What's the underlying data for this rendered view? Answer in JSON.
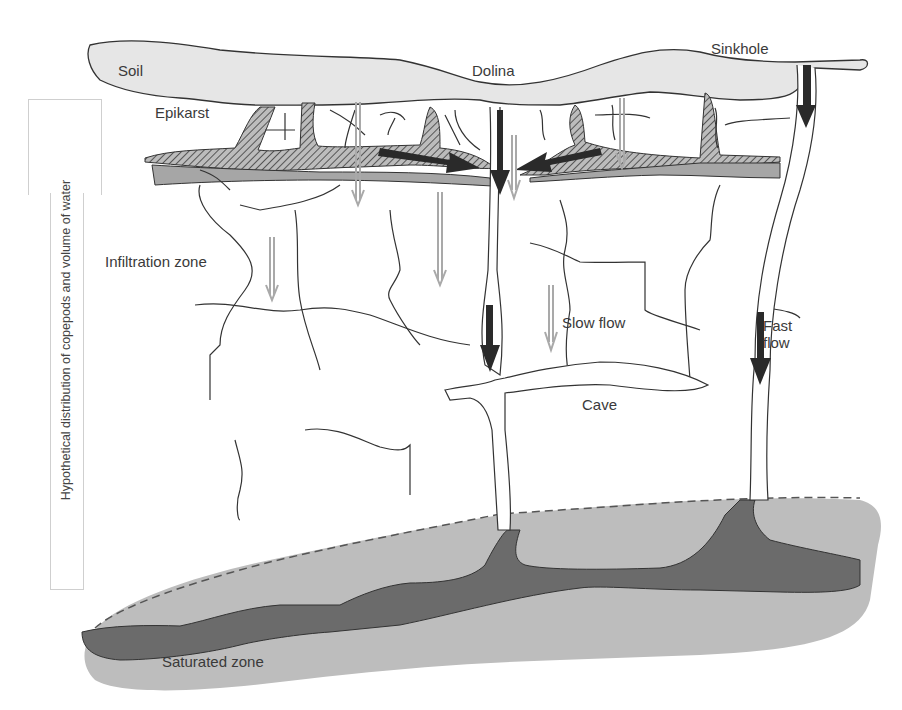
{
  "labels": {
    "soil": "Soil",
    "dolina": "Dolina",
    "sinkhole": "Sinkhole",
    "epikarst": "Epikarst",
    "infiltration_zone": "Infiltration zone",
    "slow_flow": "Slow flow",
    "fast_flow_line1": "Fast",
    "fast_flow_line2": "flow",
    "cave": "Cave",
    "saturated_zone": "Saturated zone"
  },
  "side_axis": {
    "text": "Hypothetical distribution of copepods and volume of water"
  },
  "colors": {
    "soil_fill": "#e6e6e6",
    "epikarst_hatch": "#8c8c8c",
    "epikarst_band": "#a6a6a6",
    "saturated_light": "#bdbdbd",
    "saturated_dark": "#6b6b6b",
    "fast_arrow": "#2a2a2a",
    "slow_arrow": "#a9a9a9",
    "line": "#333333"
  }
}
